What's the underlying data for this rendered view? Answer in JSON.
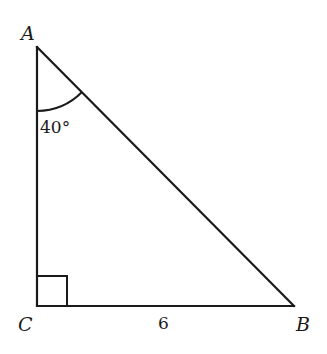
{
  "diagram": {
    "type": "right-triangle",
    "vertices": [
      {
        "label": "A",
        "x": 37,
        "y": 47
      },
      {
        "label": "C",
        "x": 37,
        "y": 306
      },
      {
        "label": "B",
        "x": 294,
        "y": 306
      }
    ],
    "angle_label": "40°",
    "angle_vertex": "A",
    "right_angle_vertex": "C",
    "side_label": "6",
    "side_labeled": "CB",
    "stroke_color": "#1a1a1a",
    "background_color": "#ffffff"
  }
}
